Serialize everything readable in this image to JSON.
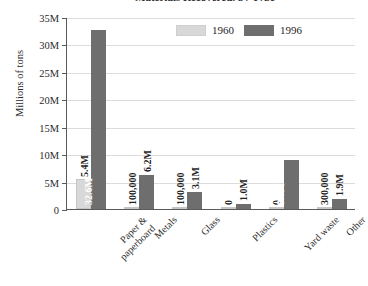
{
  "chart_data": {
    "type": "bar",
    "title": "Materials Recovered, by Type",
    "xlabel": "",
    "ylabel": "Millions of tons",
    "ylim": [
      0,
      35000000
    ],
    "grid": true,
    "legend_position": "top-center",
    "categories": [
      "Paper &\npaperboard",
      "Metals",
      "Glass",
      "Plastics",
      "Yard waste",
      "Other"
    ],
    "ytick_labels": [
      "0",
      "5M",
      "10M",
      "15M",
      "20M",
      "25M",
      "30M",
      "35M"
    ],
    "ytick_values": [
      0,
      5000000,
      10000000,
      15000000,
      20000000,
      25000000,
      30000000,
      35000000
    ],
    "series": [
      {
        "name": "1960",
        "color": "#d8d8d8",
        "values": [
          5400000,
          100000,
          100000,
          0,
          0,
          300000
        ],
        "labels": [
          "5.4M",
          "100,000",
          "100,000",
          "0",
          "0",
          "300,000"
        ]
      },
      {
        "name": "1996",
        "color": "#6e6e6e",
        "values": [
          32600000,
          6200000,
          3100000,
          1000000,
          9000000,
          1900000
        ],
        "labels": [
          "32.6M",
          "6.2M",
          "3.1M",
          "1.0M",
          "9.0M",
          "1.9M"
        ]
      }
    ]
  }
}
